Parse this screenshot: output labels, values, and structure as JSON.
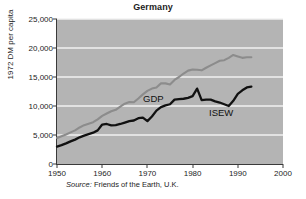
{
  "chart_data": {
    "type": "line",
    "title": "Germany",
    "xlabel": "",
    "ylabel": "1972 DM per capita",
    "xlim": [
      1950,
      2000
    ],
    "ylim": [
      0,
      25000
    ],
    "xticks": [
      "1950",
      "1960",
      "1970",
      "1980",
      "1990",
      "2000"
    ],
    "xtick_values": [
      1950,
      1960,
      1970,
      1980,
      1990,
      2000
    ],
    "yticks": [
      "0",
      "5,000",
      "10,000",
      "15,000",
      "20,000",
      "25,000"
    ],
    "ytick_values": [
      0,
      5000,
      10000,
      15000,
      20000,
      25000
    ],
    "grid": "horizontal-white",
    "legend": "inline-labels",
    "plot_background": "#b4b4b4",
    "source": "Source: Friends of the Earth, U.K.",
    "source_prefix": "Source:",
    "source_rest": " Friends of the Earth, U.K.",
    "series": [
      {
        "name": "GDP",
        "color": "#8c8c8c",
        "label_x": 1968,
        "label_y": 12500,
        "x": [
          1950,
          1951,
          1952,
          1953,
          1954,
          1955,
          1956,
          1957,
          1958,
          1959,
          1960,
          1961,
          1962,
          1963,
          1964,
          1965,
          1966,
          1967,
          1968,
          1969,
          1970,
          1971,
          1972,
          1973,
          1974,
          1975,
          1976,
          1977,
          1978,
          1979,
          1980,
          1981,
          1982,
          1983,
          1984,
          1985,
          1986,
          1987,
          1988,
          1989,
          1990,
          1991,
          1992,
          1993
        ],
        "values": [
          4500,
          4800,
          5100,
          5450,
          5800,
          6300,
          6700,
          6950,
          7200,
          7700,
          8300,
          8700,
          9100,
          9350,
          9900,
          10400,
          10700,
          10650,
          11300,
          12000,
          12600,
          13000,
          13200,
          13900,
          13900,
          13700,
          14500,
          15000,
          15600,
          16100,
          16300,
          16250,
          16150,
          16600,
          17000,
          17400,
          17800,
          17900,
          18300,
          18800,
          18550,
          18300,
          18400,
          18400
        ]
      },
      {
        "name": "ISEW",
        "color": "#111111",
        "label_x": 1985,
        "label_y": 13100,
        "x": [
          1950,
          1951,
          1952,
          1953,
          1954,
          1955,
          1956,
          1957,
          1958,
          1959,
          1960,
          1961,
          1962,
          1963,
          1964,
          1965,
          1966,
          1967,
          1968,
          1969,
          1970,
          1971,
          1972,
          1973,
          1974,
          1975,
          1976,
          1977,
          1978,
          1979,
          1980,
          1981,
          1982,
          1983,
          1984,
          1985,
          1986,
          1987,
          1988,
          1989,
          1990,
          1991,
          1992,
          1993
        ],
        "values": [
          3000,
          3250,
          3550,
          3900,
          4200,
          4600,
          4900,
          5150,
          5400,
          5800,
          6800,
          6900,
          6650,
          6700,
          6900,
          7150,
          7400,
          7500,
          7900,
          8000,
          7400,
          8200,
          9200,
          9800,
          10100,
          10300,
          11100,
          11200,
          11250,
          11400,
          11700,
          13000,
          11000,
          11100,
          11100,
          10800,
          10600,
          10300,
          10000,
          10900,
          12100,
          12700,
          13200,
          13350
        ]
      }
    ]
  }
}
